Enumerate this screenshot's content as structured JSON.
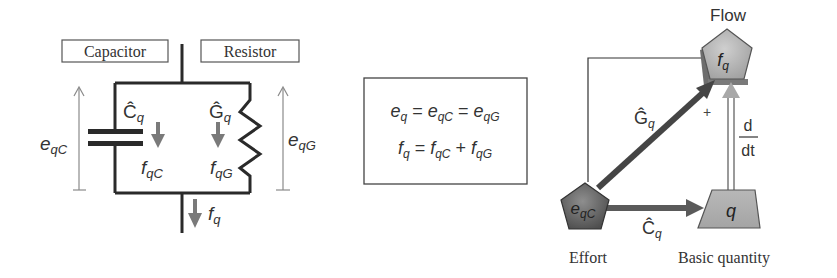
{
  "circuit": {
    "capacitor_label": "Capacitor",
    "resistor_label": "Resistor",
    "c_hat": "Ĉ",
    "g_hat": "Ĝ",
    "sub_q": "q",
    "e_qC_base": "e",
    "e_qC_sub": "qC",
    "e_qG_base": "e",
    "e_qG_sub": "qG",
    "f_qC_base": "f",
    "f_qC_sub": "qC",
    "f_qG_base": "f",
    "f_qG_sub": "qG",
    "f_q_base": "f",
    "f_q_sub": "q"
  },
  "equations": {
    "line1": {
      "parts": [
        "e",
        "q",
        " = ",
        "e",
        "qC",
        " = ",
        "e",
        "qG"
      ]
    },
    "line2": {
      "parts": [
        "f",
        "q",
        " = ",
        "f",
        "qC",
        " + ",
        "f",
        "qG"
      ]
    }
  },
  "graph": {
    "flow_label": "Flow",
    "flow_node": {
      "base": "f",
      "sub": "q"
    },
    "effort_node": {
      "base": "e",
      "sub": "qC"
    },
    "basic_node": {
      "text": "q"
    },
    "effort_label": "Effort",
    "basic_label": "Basic quantity",
    "g_edge": {
      "base": "Ĝ",
      "sub": "q"
    },
    "c_edge": {
      "base": "Ĉ",
      "sub": "q"
    },
    "plus_sign": "+",
    "derivative_num": "d",
    "derivative_den": "dt"
  },
  "colors": {
    "line": "#2a2a2a",
    "arrow_gray": "#7a7a7a",
    "node_fill": "#b4b4b4",
    "node_dark": "#6e6e6e",
    "thin_arrow": "#8a8a8a"
  }
}
